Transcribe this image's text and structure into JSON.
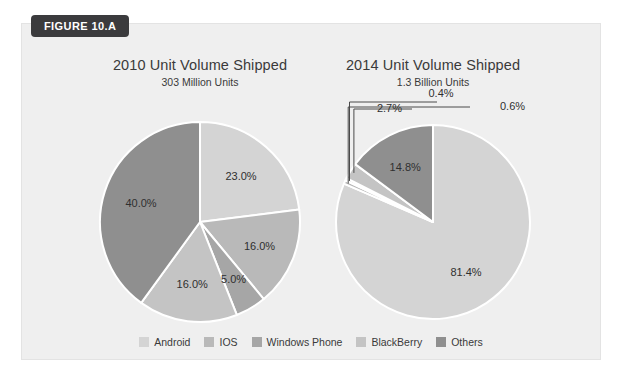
{
  "figure": {
    "tag_label": "FIGURE 10.A",
    "panel_background": "#efefef",
    "tag_background": "#3b3b3d"
  },
  "legend": {
    "position": "bottom-center",
    "items": [
      {
        "label": "Android",
        "color": "#d4d4d4"
      },
      {
        "label": "IOS",
        "color": "#b9b9b9"
      },
      {
        "label": "Windows Phone",
        "color": "#a6a6a6"
      },
      {
        "label": "BlackBerry",
        "color": "#c4c4c4"
      },
      {
        "label": "Others",
        "color": "#8f8f8f"
      }
    ]
  },
  "chart_data": [
    {
      "type": "pie",
      "title": "2010 Unit Volume Shipped",
      "subtitle": "303 Million Units",
      "total_label": "303 Million Units",
      "categories": [
        "Android",
        "IOS",
        "Windows Phone",
        "BlackBerry",
        "Others"
      ],
      "values": [
        23.0,
        16.0,
        5.0,
        16.0,
        40.0
      ],
      "value_labels": [
        "23.0%",
        "16.0%",
        "5.0%",
        "16.0%",
        "40.0%"
      ],
      "colors": [
        "#d4d4d4",
        "#b9b9b9",
        "#a6a6a6",
        "#c4c4c4",
        "#8f8f8f"
      ],
      "start_angle": 0,
      "direction": "clockwise",
      "legend": "shared-bottom"
    },
    {
      "type": "pie",
      "title": "2014 Unit Volume Shipped",
      "subtitle": "1.3 Billion Units",
      "total_label": "1.3 Billion Units",
      "categories": [
        "Android",
        "IOS",
        "Windows Phone",
        "BlackBerry",
        "Others"
      ],
      "values": [
        81.4,
        0.6,
        0.4,
        2.7,
        14.8
      ],
      "value_labels": [
        "81.4%",
        "0.6%",
        "0.4%",
        "2.7%",
        "14.8%"
      ],
      "colors": [
        "#d4d4d4",
        "#b9b9b9",
        "#a6a6a6",
        "#c4c4c4",
        "#8f8f8f"
      ],
      "start_angle": 0,
      "direction": "clockwise",
      "legend": "shared-bottom"
    }
  ]
}
